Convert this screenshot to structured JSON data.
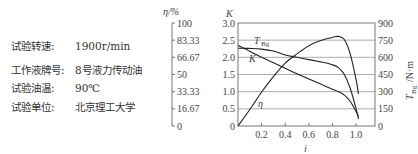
{
  "test_info": [
    {
      "label": "试验转速:",
      "value": "1900r/min"
    },
    {
      "label": "工作液牌号:",
      "value": "8号液力传动油"
    },
    {
      "label": "试验油温:",
      "value": "90℃"
    },
    {
      "label": "试验单位:",
      "value": "北京理工大学"
    }
  ],
  "axes": {
    "eta_label": "η/%",
    "k_label": "K",
    "x_label": "i",
    "right_label": "T_Bg/N·m",
    "right_label_main": "T",
    "right_label_sub": "Bg",
    "right_label_unit": "/N·m"
  },
  "curve_labels": {
    "T": "T",
    "T_sub": "Bg",
    "K": "K",
    "eta": "η"
  },
  "chart_data": {
    "type": "line",
    "title": "",
    "xlabel": "i",
    "ylabel_left": "K",
    "ylabel_right": "T_Bg / N·m",
    "ylabel_eta": "η/%",
    "xlim": [
      0,
      1.16
    ],
    "ylim_left": [
      0,
      3.0
    ],
    "ylim_right": [
      0,
      900
    ],
    "ylim_eta": [
      0,
      100
    ],
    "x_ticks": [
      "0.2",
      "0.4",
      "0.6",
      "0.8",
      "1.0"
    ],
    "y_ticks_left": [
      "0",
      "0.5",
      "1.0",
      "1.5",
      "2.0",
      "2.5",
      "3.0"
    ],
    "y_ticks_right": [
      "0",
      "150",
      "300",
      "450",
      "600",
      "750",
      "900"
    ],
    "y_ticks_eta": [
      "0",
      "16.67",
      "33.33",
      "50",
      "66.67",
      "83.33",
      "100"
    ],
    "grid": "horizontal",
    "series": [
      {
        "name": "η",
        "axis": "eta",
        "x": [
          0,
          0.1,
          0.2,
          0.3,
          0.4,
          0.5,
          0.6,
          0.7,
          0.8,
          0.85,
          0.9,
          0.95,
          1.0,
          1.02
        ],
        "values": [
          0,
          16,
          33,
          48,
          61,
          70,
          78,
          83,
          86,
          87,
          84,
          70,
          45,
          31
        ]
      },
      {
        "name": "T_Bg",
        "axis": "right",
        "x": [
          0,
          0.1,
          0.2,
          0.3,
          0.4,
          0.5,
          0.6,
          0.7,
          0.8,
          0.85,
          0.9,
          0.95,
          1.0,
          1.02
        ],
        "values": [
          680,
          678,
          672,
          655,
          620,
          600,
          580,
          560,
          535,
          510,
          450,
          330,
          150,
          60
        ]
      },
      {
        "name": "K",
        "axis": "left",
        "x": [
          0,
          0.1,
          0.2,
          0.3,
          0.4,
          0.5,
          0.6,
          0.7,
          0.8,
          0.85,
          0.9,
          0.95,
          1.0,
          1.02
        ],
        "values": [
          2.35,
          2.18,
          2.0,
          1.84,
          1.68,
          1.52,
          1.37,
          1.22,
          1.07,
          1.0,
          0.9,
          0.72,
          0.42,
          0.28
        ]
      }
    ]
  }
}
